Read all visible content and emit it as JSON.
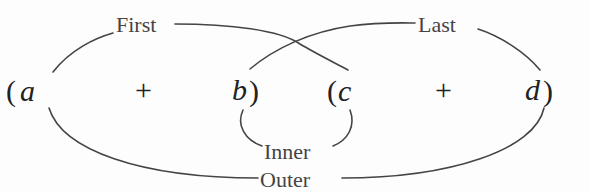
{
  "expression": {
    "open1": "(",
    "a": "a",
    "plus1": "+",
    "b": "b",
    "close1": ")",
    "open2": "(",
    "c": "c",
    "plus2": "+",
    "d": "d",
    "close2": ")"
  },
  "labels": {
    "first": "First",
    "last": "Last",
    "inner": "Inner",
    "outer": "Outer"
  },
  "colors": {
    "text": "#222222",
    "lines": "#444444",
    "background": "#fdfdfd"
  }
}
